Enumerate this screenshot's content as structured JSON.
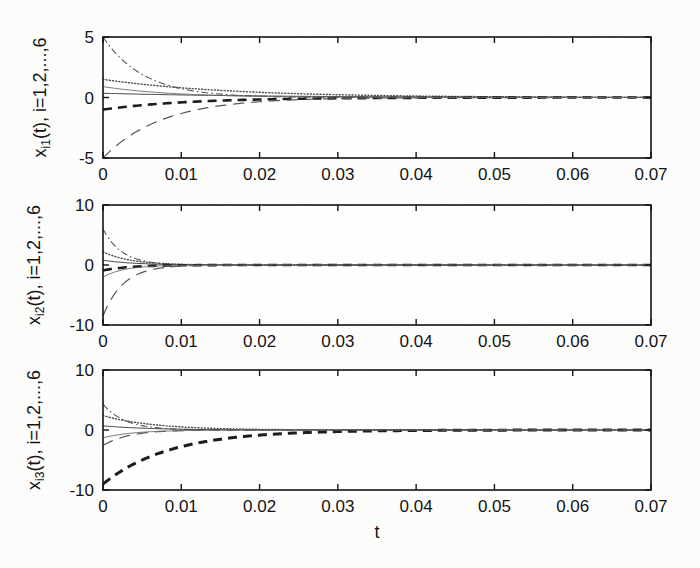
{
  "figure": {
    "kind": "multi-panel-time-series",
    "panel_count": 3,
    "xlabel": "t",
    "background": "#fdfdfc",
    "ink": "#111111"
  },
  "chart_data": [
    {
      "type": "line",
      "panel_index": 0,
      "title": "",
      "ylabel": "x_i1(t), i=1,2,...,6",
      "ylabel_base": "x",
      "ylabel_sub": "i1",
      "ylabel_rest": "(t), i=1,2,...,6",
      "xlabel": "",
      "xlim": [
        0,
        0.07
      ],
      "ylim": [
        -5,
        5
      ],
      "xticks": [
        0,
        0.01,
        0.02,
        0.03,
        0.04,
        0.05,
        0.06,
        0.07
      ],
      "xticklabels": [
        "0",
        "0.01",
        "0.02",
        "0.03",
        "0.04",
        "0.05",
        "0.06",
        "0.07"
      ],
      "yticks": [
        -5,
        0,
        5
      ],
      "yticklabels": [
        "-5",
        "0",
        "5"
      ],
      "grid": false,
      "legend": null,
      "series": [
        {
          "name": "x_11",
          "style": "dashdot",
          "width": 1.1,
          "color": "#555555",
          "y0": 5.0,
          "yinf": 0.0,
          "tau": 0.0052,
          "x": [
            0,
            0.002,
            0.004,
            0.006,
            0.008,
            0.01,
            0.014,
            0.02,
            0.03,
            0.05,
            0.07
          ],
          "values": [
            5.0,
            3.45,
            2.38,
            1.64,
            1.13,
            0.78,
            0.37,
            0.12,
            0.02,
            0.0,
            0.0
          ]
        },
        {
          "name": "x_21",
          "style": "dotted",
          "width": 1.4,
          "color": "#4a4a4a",
          "y0": 1.5,
          "yinf": 0.0,
          "tau": 0.016,
          "x": [
            0,
            0.002,
            0.004,
            0.006,
            0.008,
            0.01,
            0.014,
            0.02,
            0.03,
            0.05,
            0.07
          ],
          "values": [
            1.5,
            1.32,
            1.17,
            1.03,
            0.91,
            0.8,
            0.62,
            0.43,
            0.23,
            0.06,
            0.02
          ]
        },
        {
          "name": "x_31",
          "style": "solid",
          "width": 1.0,
          "color": "#444444",
          "y0": 0.35,
          "yinf": 0.0,
          "tau": 0.02,
          "x": [
            0,
            0.002,
            0.004,
            0.006,
            0.008,
            0.01,
            0.014,
            0.02,
            0.03,
            0.05,
            0.07
          ],
          "values": [
            0.35,
            0.32,
            0.29,
            0.26,
            0.23,
            0.21,
            0.17,
            0.13,
            0.07,
            0.02,
            0.01
          ]
        },
        {
          "name": "x_41",
          "style": "dashed-thick",
          "width": 2.6,
          "color": "#1a1a1a",
          "y0": -1.0,
          "yinf": 0.0,
          "tau": 0.011,
          "x": [
            0,
            0.002,
            0.004,
            0.006,
            0.008,
            0.01,
            0.014,
            0.02,
            0.03,
            0.05,
            0.07
          ],
          "values": [
            -1.0,
            -0.84,
            -0.7,
            -0.58,
            -0.49,
            -0.41,
            -0.28,
            -0.16,
            -0.06,
            -0.01,
            0.0
          ]
        },
        {
          "name": "x_51",
          "style": "longdash",
          "width": 1.2,
          "color": "#555555",
          "y0": -5.0,
          "yinf": 0.0,
          "tau": 0.0075,
          "x": [
            0,
            0.002,
            0.004,
            0.006,
            0.008,
            0.01,
            0.014,
            0.02,
            0.03,
            0.05,
            0.07
          ],
          "values": [
            -5.0,
            -3.83,
            -2.93,
            -2.25,
            -1.72,
            -1.32,
            -0.78,
            -0.35,
            -0.07,
            0.0,
            0.0
          ]
        },
        {
          "name": "x_61",
          "style": "solid-thin",
          "width": 0.9,
          "color": "#666666",
          "y0": 0.9,
          "yinf": 0.0,
          "tau": 0.009,
          "x": [
            0,
            0.002,
            0.004,
            0.006,
            0.008,
            0.01,
            0.014,
            0.02,
            0.03,
            0.05,
            0.07
          ],
          "values": [
            0.9,
            0.72,
            0.58,
            0.46,
            0.37,
            0.3,
            0.19,
            0.1,
            0.03,
            0.0,
            0.0
          ]
        }
      ]
    },
    {
      "type": "line",
      "panel_index": 1,
      "title": "",
      "ylabel": "x_i2(t), i=1,2,...,6",
      "ylabel_base": "x",
      "ylabel_sub": "i2",
      "ylabel_rest": "(t), i=1,2,...,6",
      "xlabel": "",
      "xlim": [
        0,
        0.07
      ],
      "ylim": [
        -10,
        10
      ],
      "xticks": [
        0,
        0.01,
        0.02,
        0.03,
        0.04,
        0.05,
        0.06,
        0.07
      ],
      "xticklabels": [
        "0",
        "0.01",
        "0.02",
        "0.03",
        "0.04",
        "0.05",
        "0.06",
        "0.07"
      ],
      "yticks": [
        -10,
        0,
        10
      ],
      "yticklabels": [
        "-10",
        "0",
        "10"
      ],
      "grid": false,
      "legend": null,
      "series": [
        {
          "name": "x_12",
          "style": "dashdot",
          "width": 1.1,
          "color": "#555555",
          "y0": 6.0,
          "yinf": 0.0,
          "tau": 0.0024,
          "x": [
            0,
            0.001,
            0.002,
            0.003,
            0.004,
            0.006,
            0.008,
            0.012,
            0.02,
            0.04,
            0.07
          ],
          "values": [
            6.0,
            3.95,
            2.6,
            1.71,
            1.13,
            0.49,
            0.21,
            0.04,
            0.0,
            0.0,
            0.0
          ]
        },
        {
          "name": "x_22",
          "style": "dotted",
          "width": 1.4,
          "color": "#4a4a4a",
          "y0": 2.2,
          "yinf": 0.0,
          "tau": 0.0035,
          "x": [
            0,
            0.001,
            0.002,
            0.003,
            0.004,
            0.006,
            0.008,
            0.012,
            0.02,
            0.04,
            0.07
          ],
          "values": [
            2.2,
            1.65,
            1.25,
            0.94,
            0.71,
            0.4,
            0.23,
            0.07,
            0.01,
            0.0,
            0.0
          ]
        },
        {
          "name": "x_32",
          "style": "solid",
          "width": 1.0,
          "color": "#444444",
          "y0": 0.8,
          "yinf": 0.0,
          "tau": 0.004,
          "x": [
            0,
            0.001,
            0.002,
            0.003,
            0.004,
            0.006,
            0.008,
            0.012,
            0.02,
            0.04,
            0.07
          ],
          "values": [
            0.8,
            0.62,
            0.49,
            0.38,
            0.29,
            0.18,
            0.11,
            0.04,
            0.01,
            0.0,
            0.0
          ]
        },
        {
          "name": "x_42",
          "style": "dashed-thick",
          "width": 2.6,
          "color": "#1a1a1a",
          "y0": -0.9,
          "yinf": 0.0,
          "tau": 0.0035,
          "x": [
            0,
            0.001,
            0.002,
            0.003,
            0.004,
            0.006,
            0.008,
            0.012,
            0.02,
            0.04,
            0.07
          ],
          "values": [
            -0.9,
            -0.68,
            -0.51,
            -0.39,
            -0.29,
            -0.17,
            -0.09,
            -0.03,
            0.0,
            0.0,
            0.0
          ]
        },
        {
          "name": "x_52",
          "style": "longdash",
          "width": 1.2,
          "color": "#555555",
          "y0": -8.5,
          "yinf": 0.0,
          "tau": 0.0026,
          "x": [
            0,
            0.001,
            0.002,
            0.003,
            0.004,
            0.006,
            0.008,
            0.012,
            0.02,
            0.04,
            0.07
          ],
          "values": [
            -8.5,
            -5.8,
            -3.96,
            -2.7,
            -1.84,
            -0.86,
            -0.4,
            -0.09,
            -0.01,
            0.0,
            0.0
          ]
        },
        {
          "name": "x_62",
          "style": "solid-thin",
          "width": 0.9,
          "color": "#666666",
          "y0": -2.0,
          "yinf": 0.0,
          "tau": 0.0028,
          "x": [
            0,
            0.001,
            0.002,
            0.003,
            0.004,
            0.006,
            0.008,
            0.012,
            0.02,
            0.04,
            0.07
          ],
          "values": [
            -2.0,
            -1.4,
            -0.98,
            -0.69,
            -0.48,
            -0.24,
            -0.12,
            -0.03,
            0.0,
            0.0,
            0.0
          ]
        }
      ]
    },
    {
      "type": "line",
      "panel_index": 2,
      "title": "",
      "ylabel": "x_i3(t), i=1,2,...,6",
      "ylabel_base": "x",
      "ylabel_sub": "i3",
      "ylabel_rest": "(t), i=1,2,...,6",
      "xlabel": "t",
      "xlim": [
        0,
        0.07
      ],
      "ylim": [
        -10,
        10
      ],
      "xticks": [
        0,
        0.01,
        0.02,
        0.03,
        0.04,
        0.05,
        0.06,
        0.07
      ],
      "xticklabels": [
        "0",
        "0.01",
        "0.02",
        "0.03",
        "0.04",
        "0.05",
        "0.06",
        "0.07"
      ],
      "yticks": [
        -10,
        0,
        10
      ],
      "yticklabels": [
        "-10",
        "0",
        "10"
      ],
      "grid": false,
      "legend": null,
      "series": [
        {
          "name": "x_13",
          "style": "dashdot",
          "width": 1.1,
          "color": "#555555",
          "y0": 4.3,
          "yinf": 0.0,
          "tau": 0.0028,
          "x": [
            0,
            0.001,
            0.002,
            0.003,
            0.004,
            0.006,
            0.008,
            0.012,
            0.02,
            0.04,
            0.07
          ],
          "values": [
            4.3,
            3.02,
            2.12,
            1.49,
            1.04,
            0.51,
            0.25,
            0.06,
            0.01,
            0.0,
            0.0
          ]
        },
        {
          "name": "x_23",
          "style": "dotted",
          "width": 1.4,
          "color": "#4a4a4a",
          "y0": 2.4,
          "yinf": 0.0,
          "tau": 0.0065,
          "x": [
            0,
            0.001,
            0.002,
            0.003,
            0.004,
            0.006,
            0.008,
            0.012,
            0.02,
            0.04,
            0.07
          ],
          "values": [
            2.4,
            2.06,
            1.77,
            1.52,
            1.3,
            0.96,
            0.71,
            0.38,
            0.11,
            0.01,
            0.0
          ]
        },
        {
          "name": "x_33",
          "style": "solid",
          "width": 1.0,
          "color": "#444444",
          "y0": 0.7,
          "yinf": 0.0,
          "tau": 0.006,
          "x": [
            0,
            0.001,
            0.002,
            0.003,
            0.004,
            0.006,
            0.008,
            0.012,
            0.02,
            0.04,
            0.07
          ],
          "values": [
            0.7,
            0.59,
            0.5,
            0.42,
            0.36,
            0.26,
            0.18,
            0.09,
            0.02,
            0.0,
            0.0
          ]
        },
        {
          "name": "x_43",
          "style": "dashed-thick",
          "width": 3.0,
          "color": "#1a1a1a",
          "y0": -9.0,
          "yinf": 0.0,
          "tau": 0.0085,
          "x": [
            0,
            0.002,
            0.004,
            0.006,
            0.008,
            0.01,
            0.014,
            0.018,
            0.022,
            0.03,
            0.05,
            0.07
          ],
          "values": [
            -9.0,
            -7.13,
            -5.65,
            -4.47,
            -3.54,
            -2.81,
            -1.76,
            -1.11,
            -0.69,
            -0.27,
            -0.02,
            0.0
          ]
        },
        {
          "name": "x_53",
          "style": "longdash",
          "width": 1.2,
          "color": "#555555",
          "y0": -2.6,
          "yinf": 0.0,
          "tau": 0.0032,
          "x": [
            0,
            0.001,
            0.002,
            0.003,
            0.004,
            0.006,
            0.008,
            0.012,
            0.02,
            0.04,
            0.07
          ],
          "values": [
            -2.6,
            -1.91,
            -1.4,
            -1.03,
            -0.75,
            -0.4,
            -0.21,
            -0.06,
            0.0,
            0.0,
            0.0
          ]
        },
        {
          "name": "x_63",
          "style": "solid-thin",
          "width": 0.9,
          "color": "#666666",
          "y0": -1.3,
          "yinf": 0.0,
          "tau": 0.004,
          "x": [
            0,
            0.001,
            0.002,
            0.003,
            0.004,
            0.006,
            0.008,
            0.012,
            0.02,
            0.04,
            0.07
          ],
          "values": [
            -1.3,
            -1.01,
            -0.79,
            -0.61,
            -0.48,
            -0.29,
            -0.18,
            -0.06,
            0.01,
            0.0,
            0.0
          ]
        }
      ]
    }
  ]
}
